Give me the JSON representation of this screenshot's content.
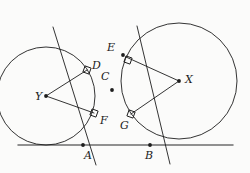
{
  "figure": {
    "type": "geometry-diagram",
    "background_color": "#fbfbfa",
    "stroke_color": "#1d1d1d",
    "baseline_color": "#6e6e6e"
  },
  "labels": [
    {
      "id": "Y",
      "text": "Y",
      "x": 35,
      "y": 91,
      "role": "circle-center"
    },
    {
      "id": "X",
      "text": "X",
      "x": 185,
      "y": 74,
      "role": "circle-center"
    },
    {
      "id": "D",
      "text": "D",
      "x": 92,
      "y": 60,
      "role": "tangency-point"
    },
    {
      "id": "C",
      "text": "C",
      "x": 101,
      "y": 71,
      "role": "intersection-point"
    },
    {
      "id": "E",
      "text": "E",
      "x": 107,
      "y": 42,
      "role": "tangency-point"
    },
    {
      "id": "F",
      "text": "F",
      "x": 100,
      "y": 115,
      "role": "tangency-point"
    },
    {
      "id": "G",
      "text": "G",
      "x": 120,
      "y": 120,
      "role": "tangency-point"
    },
    {
      "id": "A",
      "text": "A",
      "x": 84,
      "y": 150,
      "role": "tangency-point"
    },
    {
      "id": "B",
      "text": "B",
      "x": 145,
      "y": 150,
      "role": "tangency-point"
    }
  ],
  "circles": [
    {
      "id": "circle-Y",
      "cx": 46,
      "cy": 96,
      "r": 49
    },
    {
      "id": "circle-X",
      "cx": 179,
      "cy": 81,
      "r": 58
    }
  ],
  "points": [
    {
      "id": "point-Y",
      "cx": 46,
      "cy": 96
    },
    {
      "id": "point-X",
      "cx": 179,
      "cy": 81
    },
    {
      "id": "point-C",
      "cx": 112,
      "cy": 90
    },
    {
      "id": "point-E",
      "cx": 123,
      "cy": 55
    },
    {
      "id": "point-A",
      "cx": 83,
      "cy": 145
    },
    {
      "id": "point-B",
      "cx": 150,
      "cy": 145
    }
  ],
  "squares": [
    {
      "id": "right-angle-D",
      "cx": 87,
      "cy": 70
    },
    {
      "id": "right-angle-E",
      "cx": 128,
      "cy": 60
    },
    {
      "id": "right-angle-F",
      "cx": 94,
      "cy": 113
    },
    {
      "id": "right-angle-G",
      "cx": 131,
      "cy": 114
    }
  ],
  "lines": {
    "baseline": {
      "x1": 18,
      "y1": 145,
      "x2": 233,
      "y2": 145
    },
    "tangent_left": {
      "x1": 53,
      "y1": 27,
      "x2": 96,
      "y2": 165
    },
    "tangent_right": {
      "x1": 137,
      "y1": 26,
      "x2": 170,
      "y2": 164
    },
    "radius_YD": {
      "x1": 46,
      "y1": 96,
      "x2": 87,
      "y2": 70
    },
    "radius_YF": {
      "x1": 46,
      "y1": 96,
      "x2": 94,
      "y2": 113
    },
    "radius_XE": {
      "x1": 179,
      "y1": 81,
      "x2": 126,
      "y2": 57
    },
    "radius_XG": {
      "x1": 179,
      "y1": 81,
      "x2": 131,
      "y2": 114
    }
  }
}
